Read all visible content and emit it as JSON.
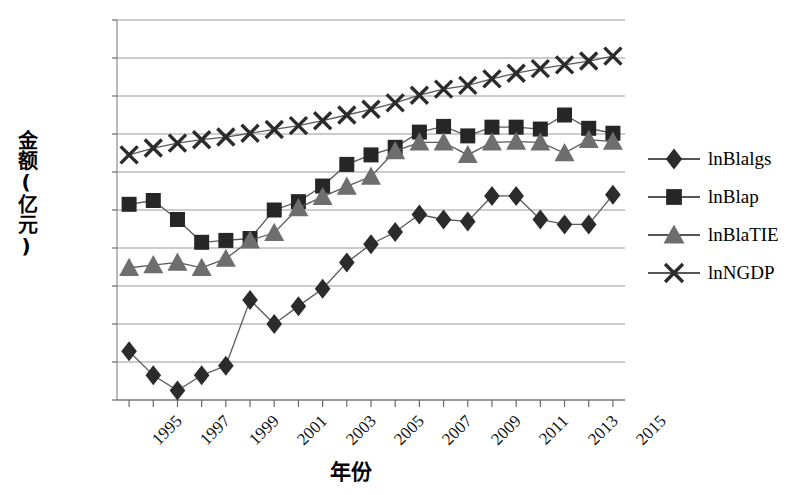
{
  "chart_data": {
    "type": "line",
    "title": "",
    "xlabel": "年份",
    "ylabel": "金额(亿元)",
    "x": [
      1995,
      1996,
      1997,
      1998,
      1999,
      2000,
      2001,
      2002,
      2003,
      2004,
      2005,
      2006,
      2007,
      2008,
      2009,
      2010,
      2011,
      2012,
      2013,
      2014,
      2015
    ],
    "xtick_labels": [
      "1995",
      "1997",
      "1999",
      "2001",
      "2003",
      "2005",
      "2007",
      "2009",
      "2011",
      "2013",
      "2015"
    ],
    "xtick_values": [
      1995,
      1997,
      1999,
      2001,
      2003,
      2005,
      2007,
      2009,
      2011,
      2013,
      2015
    ],
    "ytick_labels": [
      "0.000 0",
      "1.000 0",
      "2.000 0",
      "3.000 0",
      "4.000 0",
      "5.000 0",
      "6.000 0",
      "7.000 0",
      "8.000 0",
      "9.000 0",
      "10.000 0"
    ],
    "ytick_values": [
      0,
      1,
      2,
      3,
      4,
      5,
      6,
      7,
      8,
      9,
      10
    ],
    "ylim": [
      0,
      10
    ],
    "xlim": [
      1994.5,
      2015.5
    ],
    "grid": true,
    "grid_axis": "y",
    "legend_position": "right",
    "series": [
      {
        "name": "lnBlalgs",
        "marker": "diamond",
        "color": "#2b2b2b",
        "values": [
          1.28,
          0.65,
          0.25,
          0.65,
          0.9,
          2.63,
          2.0,
          2.47,
          2.93,
          3.62,
          4.1,
          4.42,
          4.88,
          4.75,
          4.7,
          5.37,
          5.37,
          4.75,
          4.62,
          4.62,
          5.4
        ]
      },
      {
        "name": "lnBlap",
        "marker": "square",
        "color": "#262626",
        "values": [
          5.15,
          5.25,
          4.75,
          4.15,
          4.2,
          4.25,
          5.0,
          5.22,
          5.63,
          6.2,
          6.45,
          6.65,
          7.05,
          7.2,
          6.95,
          7.18,
          7.18,
          7.13,
          7.5,
          7.15,
          7.02
        ]
      },
      {
        "name": "lnBlaTIE",
        "marker": "triangle",
        "color": "#6e6e6e",
        "values": [
          3.48,
          3.55,
          3.62,
          3.48,
          3.72,
          4.2,
          4.4,
          5.05,
          5.35,
          5.62,
          5.88,
          6.55,
          6.78,
          6.78,
          6.45,
          6.78,
          6.8,
          6.78,
          6.5,
          6.85,
          6.8
        ]
      },
      {
        "name": "lnNGDP",
        "marker": "cross",
        "color": "#2b2b2b",
        "values": [
          6.45,
          6.63,
          6.76,
          6.85,
          6.92,
          7.02,
          7.12,
          7.22,
          7.35,
          7.5,
          7.65,
          7.82,
          8.02,
          8.18,
          8.28,
          8.45,
          8.6,
          8.72,
          8.82,
          8.92,
          9.05
        ]
      }
    ]
  },
  "legend": {
    "items": [
      {
        "label": "lnBlalgs",
        "marker": "diamond"
      },
      {
        "label": "lnBlap",
        "marker": "square"
      },
      {
        "label": "lnBlaTIE",
        "marker": "triangle"
      },
      {
        "label": "lnNGDP",
        "marker": "cross"
      }
    ]
  }
}
